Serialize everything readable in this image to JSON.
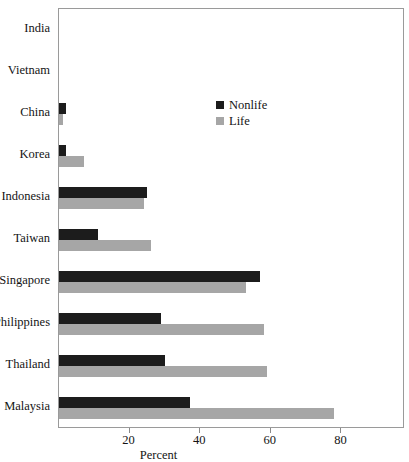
{
  "chart_data": {
    "type": "bar",
    "orientation": "horizontal",
    "title": "",
    "xlabel": "Percent",
    "ylabel": "",
    "xlim": [
      0,
      98
    ],
    "xticks": [
      20,
      40,
      60,
      80
    ],
    "xtick_labels": [
      "20",
      "40",
      "60",
      "80"
    ],
    "grid": false,
    "legend_position": "inside-upper-center",
    "categories": [
      "India",
      "Vietnam",
      "China",
      "Korea",
      "Indonesia",
      "Taiwan",
      "Singapore",
      "Philippines",
      "Thailand",
      "Malaysia"
    ],
    "series": [
      {
        "name": "Nonlife",
        "color": "#1c1c1c",
        "values": [
          0,
          0,
          2,
          2,
          25,
          11,
          57,
          29,
          30,
          37
        ]
      },
      {
        "name": "Life",
        "color": "#a6a6a6",
        "values": [
          0,
          0,
          1,
          7,
          24,
          26,
          53,
          58,
          59,
          78
        ]
      }
    ]
  },
  "legend": {
    "items": [
      {
        "label": "Nonlife",
        "color": "#1c1c1c"
      },
      {
        "label": "Life",
        "color": "#a6a6a6"
      }
    ]
  },
  "axis": {
    "x_title": "Percent"
  }
}
